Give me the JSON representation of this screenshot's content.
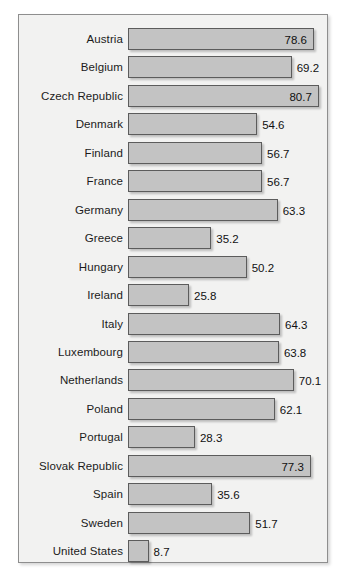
{
  "chart_data": {
    "type": "bar",
    "orientation": "horizontal",
    "title": "",
    "subtitle": "",
    "xlabel": "",
    "ylabel": "",
    "grid": false,
    "legend": null,
    "xlim": [
      0,
      85
    ],
    "categories": [
      "Austria",
      "Belgium",
      "Czech Republic",
      "Denmark",
      "Finland",
      "France",
      "Germany",
      "Greece",
      "Hungary",
      "Ireland",
      "Italy",
      "Luxembourg",
      "Netherlands",
      "Poland",
      "Portugal",
      "Slovak Republic",
      "Spain",
      "Sweden",
      "United States"
    ],
    "values": [
      78.6,
      69.2,
      80.7,
      54.6,
      56.7,
      56.7,
      63.3,
      35.2,
      50.2,
      25.8,
      64.3,
      63.8,
      70.1,
      62.1,
      28.3,
      77.3,
      35.6,
      51.7,
      8.7
    ],
    "value_labels": [
      "78.6",
      "69.2",
      "80.7",
      "54.6",
      "56.7",
      "56.7",
      "63.3",
      "35.2",
      "50.2",
      "25.8",
      "64.3",
      "63.8",
      "70.1",
      "62.1",
      "28.3",
      "77.3",
      "35.6",
      "51.7",
      "8.7"
    ],
    "label_placement": [
      "inside",
      "outside",
      "inside",
      "outside",
      "outside",
      "outside",
      "outside",
      "outside",
      "outside",
      "outside",
      "outside",
      "outside",
      "outside",
      "outside",
      "outside",
      "inside",
      "outside",
      "outside",
      "outside"
    ]
  },
  "colors": {
    "bar_fill": "#c3c3c3",
    "bar_border": "#5c5c5c",
    "panel_background": "#f2f2f1",
    "panel_border": "#8e8e8e",
    "text": "#1b1b1b",
    "page_background": "#ffffff"
  }
}
